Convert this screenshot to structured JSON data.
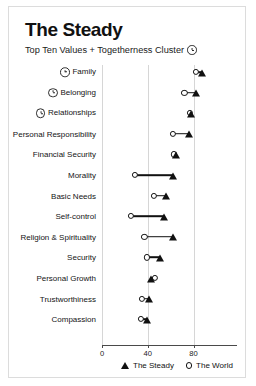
{
  "card": {
    "title": "The Steady",
    "subtitle": "Top Ten Values + Togetherness Cluster",
    "subtitle_icon": "clock-icon"
  },
  "legend": {
    "steady_label": "The Steady",
    "steady_icon": "filled-triangle-marker",
    "world_label": "The World",
    "world_icon": "open-circle-marker"
  },
  "chart_data": {
    "type": "scatter",
    "title": "The Steady",
    "subtitle": "Top Ten Values + Togetherness Cluster",
    "xlabel": "",
    "ylabel": "",
    "xlim": [
      0,
      100
    ],
    "xticks": [
      0,
      40,
      80
    ],
    "xtick_labels": [
      "0",
      "40",
      "80"
    ],
    "grid": true,
    "grid_axis": "x",
    "legend_position": "bottom-right",
    "categories": [
      "Family",
      "Belonging",
      "Relationships",
      "Personal Responsibility",
      "Financial Security",
      "Morality",
      "Basic Needs",
      "Self-control",
      "Religion & Spirituality",
      "Security",
      "Personal Growth",
      "Trustworthiness",
      "Compassion"
    ],
    "category_icons": [
      "clock-icon",
      "clock-icon",
      "clock-icon",
      "",
      "",
      "",
      "",
      "",
      "",
      "",
      "",
      "",
      ""
    ],
    "series": [
      {
        "name": "The Steady",
        "marker": "filled-triangle",
        "values": [
          87,
          82,
          78,
          76,
          65,
          62,
          56,
          54,
          62,
          51,
          43,
          41,
          39
        ]
      },
      {
        "name": "The World",
        "marker": "open-circle",
        "values": [
          82,
          72,
          77,
          62,
          63,
          29,
          45,
          25,
          37,
          39,
          46,
          35,
          34
        ]
      }
    ]
  }
}
